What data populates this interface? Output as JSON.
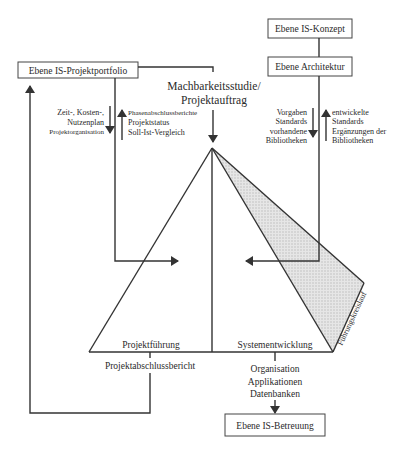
{
  "boxes": {
    "projektportfolio": "Ebene IS-Projektportfolio",
    "konzept": "Ebene IS-Konzept",
    "architektur": "Ebene Architektur",
    "betreuung": "Ebene IS-Betreuung"
  },
  "labels": {
    "machbarkeit_1": "Machbarkeitsstudie/",
    "machbarkeit_2": "Projektauftrag",
    "left_down": [
      "Zeit-, Kosten-,",
      "Nutzenplan",
      "Projektorganisation"
    ],
    "left_up": [
      "Phasenabschlussberichte",
      "Projektstatus",
      "Soll-Ist-Vergleich"
    ],
    "right_down": [
      "Vorgaben",
      "Standards",
      "vorhandene",
      "Bibliotheken"
    ],
    "right_up": [
      "entwickelte",
      "Standards",
      "Ergänzungen der",
      "Bibliotheken"
    ],
    "projektfuehrung": "Projektführung",
    "systementwicklung": "Systementwicklung",
    "fuehrungskreislauf": "Führungskreislauf",
    "projektabschlussbericht": "Projektabschlussbericht",
    "outputs": [
      "Organisation",
      "Applikationen",
      "Datenbanken"
    ]
  },
  "colors": {
    "line": "#333333",
    "shade": "#d9d9d9"
  }
}
